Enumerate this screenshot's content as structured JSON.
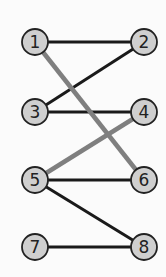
{
  "diagram": {
    "type": "bipartite-graph",
    "colors": {
      "background": "#fbfbfb",
      "node_fill": "#cfcfcf",
      "node_stroke": "#222222",
      "edge_dark": "#1a1a1a",
      "edge_highlight": "#7f7f7f"
    },
    "nodes": [
      {
        "id": "1",
        "label": "1",
        "x": 35,
        "y": 42
      },
      {
        "id": "2",
        "label": "2",
        "x": 144,
        "y": 42
      },
      {
        "id": "3",
        "label": "3",
        "x": 35,
        "y": 112
      },
      {
        "id": "4",
        "label": "4",
        "x": 144,
        "y": 112
      },
      {
        "id": "5",
        "label": "5",
        "x": 35,
        "y": 180
      },
      {
        "id": "6",
        "label": "6",
        "x": 144,
        "y": 180
      },
      {
        "id": "7",
        "label": "7",
        "x": 35,
        "y": 247
      },
      {
        "id": "8",
        "label": "8",
        "x": 144,
        "y": 247
      }
    ],
    "edges": [
      {
        "from": "1",
        "to": "2",
        "style": "dark"
      },
      {
        "from": "3",
        "to": "2",
        "style": "dark"
      },
      {
        "from": "3",
        "to": "4",
        "style": "dark"
      },
      {
        "from": "5",
        "to": "6",
        "style": "dark"
      },
      {
        "from": "5",
        "to": "8",
        "style": "dark"
      },
      {
        "from": "7",
        "to": "8",
        "style": "dark"
      },
      {
        "from": "1",
        "to": "6",
        "style": "highlight"
      },
      {
        "from": "5",
        "to": "4",
        "style": "highlight"
      }
    ]
  }
}
